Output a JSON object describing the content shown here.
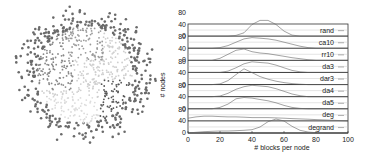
{
  "figure": {
    "left_panel": "graph-partition-visualization",
    "clusters": [
      {
        "name": "top",
        "color": "#9a9a9a"
      },
      {
        "name": "left",
        "color": "#888888"
      },
      {
        "name": "center",
        "color": "#cfcfcf"
      },
      {
        "name": "right",
        "color": "#555555"
      },
      {
        "name": "bottom",
        "color": "#dcdcdc"
      },
      {
        "name": "outer",
        "color": "#6a6a6a"
      }
    ]
  },
  "chart_data": {
    "type": "line",
    "title": "",
    "xlabel": "# blocks per node",
    "ylabel": "# nodes",
    "xlim": [
      0,
      100
    ],
    "ylim": [
      0,
      80
    ],
    "xticks": [
      "0",
      "20",
      "40",
      "60",
      "80",
      "100"
    ],
    "yticks": [
      "0",
      "40",
      "80"
    ],
    "legend_position": "right",
    "x": [
      0,
      5,
      10,
      15,
      20,
      25,
      30,
      35,
      40,
      45,
      50,
      55,
      60,
      65,
      70,
      75,
      80,
      85,
      90,
      95,
      100
    ],
    "series": [
      {
        "name": "rand",
        "values": [
          0,
          0,
          0,
          0,
          0,
          0,
          2,
          10,
          35,
          60,
          55,
          35,
          15,
          3,
          0,
          0,
          0,
          0,
          0,
          0,
          0
        ]
      },
      {
        "name": "ca10",
        "values": [
          0,
          0,
          0,
          0,
          2,
          8,
          18,
          28,
          32,
          30,
          28,
          24,
          18,
          12,
          6,
          2,
          0,
          0,
          0,
          0,
          0
        ]
      },
      {
        "name": "rr10",
        "values": [
          0,
          0,
          0,
          0,
          6,
          18,
          30,
          34,
          26,
          22,
          20,
          16,
          12,
          8,
          5,
          2,
          0,
          0,
          0,
          0,
          0
        ]
      },
      {
        "name": "da3",
        "values": [
          0,
          0,
          0,
          0,
          0,
          4,
          14,
          26,
          32,
          30,
          28,
          22,
          14,
          6,
          2,
          0,
          0,
          0,
          0,
          0,
          0
        ]
      },
      {
        "name": "dar3",
        "values": [
          0,
          0,
          0,
          0,
          2,
          12,
          30,
          52,
          36,
          24,
          16,
          10,
          6,
          3,
          1,
          0,
          0,
          0,
          0,
          0,
          0
        ]
      },
      {
        "name": "da4",
        "values": [
          0,
          0,
          0,
          0,
          2,
          10,
          22,
          30,
          34,
          32,
          30,
          24,
          16,
          8,
          3,
          0,
          0,
          0,
          0,
          0,
          0
        ]
      },
      {
        "name": "da5",
        "values": [
          0,
          0,
          0,
          0,
          4,
          14,
          30,
          34,
          32,
          28,
          24,
          18,
          10,
          4,
          1,
          0,
          0,
          0,
          0,
          0,
          0
        ]
      },
      {
        "name": "deg",
        "values": [
          8,
          12,
          14,
          14,
          13,
          12,
          12,
          11,
          10,
          10,
          10,
          9,
          8,
          7,
          6,
          5,
          4,
          3,
          2,
          1,
          0
        ]
      },
      {
        "name": "degrand",
        "values": [
          0,
          2,
          4,
          5,
          6,
          6,
          7,
          8,
          10,
          18,
          34,
          42,
          36,
          20,
          8,
          3,
          1,
          0,
          0,
          0,
          0
        ]
      }
    ]
  }
}
